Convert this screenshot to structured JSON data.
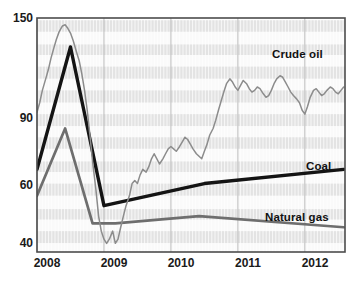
{
  "chart_data": {
    "type": "line",
    "title": "",
    "subtitle": "",
    "xlabel": "",
    "ylabel": "",
    "grid": "horizontal-bands-and-vertical-minor-lines",
    "legend_position": "inline-right-labels",
    "x_axis": {
      "tick_labels": [
        "2008",
        "2009",
        "2010",
        "2011",
        "2012"
      ],
      "tick_values": [
        2008,
        2009,
        2010,
        2011,
        2012
      ],
      "range": [
        2008.0,
        2012.6
      ]
    },
    "y_axis": {
      "tick_labels": [
        "150",
        "90",
        "60",
        "40"
      ],
      "tick_values": [
        150,
        90,
        60,
        40
      ],
      "range": [
        38,
        152
      ],
      "scale": "log"
    },
    "series": [
      {
        "name": "Crude oil",
        "color": "#8c8c8c",
        "label_text": "Crude oil",
        "x": [
          2008.0,
          2008.04,
          2008.08,
          2008.13,
          2008.17,
          2008.21,
          2008.25,
          2008.29,
          2008.33,
          2008.38,
          2008.42,
          2008.46,
          2008.5,
          2008.54,
          2008.58,
          2008.63,
          2008.67,
          2008.71,
          2008.75,
          2008.79,
          2008.83,
          2008.88,
          2008.92,
          2008.96,
          2009.0,
          2009.04,
          2009.08,
          2009.13,
          2009.17,
          2009.21,
          2009.25,
          2009.29,
          2009.33,
          2009.38,
          2009.42,
          2009.46,
          2009.5,
          2009.54,
          2009.58,
          2009.63,
          2009.67,
          2009.71,
          2009.75,
          2009.79,
          2009.83,
          2009.88,
          2009.92,
          2009.96,
          2010.0,
          2010.04,
          2010.08,
          2010.13,
          2010.17,
          2010.21,
          2010.25,
          2010.29,
          2010.33,
          2010.38,
          2010.42,
          2010.46,
          2010.5,
          2010.54,
          2010.58,
          2010.63,
          2010.67,
          2010.71,
          2010.75,
          2010.79,
          2010.83,
          2010.88,
          2010.92,
          2010.96,
          2011.0,
          2011.04,
          2011.08,
          2011.13,
          2011.17,
          2011.21,
          2011.25,
          2011.29,
          2011.33,
          2011.38,
          2011.42,
          2011.46,
          2011.5,
          2011.54,
          2011.58,
          2011.63,
          2011.67,
          2011.71,
          2011.75,
          2011.79,
          2011.83,
          2011.88,
          2011.92,
          2011.96,
          2012.0,
          2012.04,
          2012.08,
          2012.13,
          2012.17,
          2012.21,
          2012.25,
          2012.29,
          2012.33,
          2012.38,
          2012.42,
          2012.46,
          2012.5,
          2012.54,
          2012.58
        ],
        "y": [
          87,
          92,
          99,
          106,
          112,
          120,
          127,
          134,
          140,
          145,
          146,
          143,
          139,
          133,
          126,
          118,
          109,
          99,
          88,
          76,
          65,
          55,
          47,
          43,
          41,
          40,
          41,
          43,
          40,
          41,
          44,
          47,
          50,
          53,
          57,
          58,
          57,
          60,
          62,
          61,
          63,
          66,
          68,
          66,
          64,
          66,
          68,
          70,
          71,
          70,
          69,
          71,
          73,
          75,
          74,
          72,
          70,
          68,
          67,
          66,
          69,
          72,
          76,
          79,
          83,
          88,
          93,
          98,
          103,
          106,
          104,
          101,
          99,
          102,
          105,
          103,
          100,
          98,
          99,
          101,
          100,
          97,
          95,
          96,
          99,
          103,
          106,
          108,
          107,
          104,
          101,
          98,
          96,
          94,
          92,
          88,
          86,
          90,
          95,
          99,
          100,
          98,
          96,
          97,
          99,
          101,
          100,
          98,
          97,
          99,
          101
        ]
      },
      {
        "name": "Coal",
        "color": "#141414",
        "label_text": "Coal",
        "x": [
          2008.0,
          2008.5,
          2009.0,
          2010.5,
          2012.58
        ],
        "y": [
          62,
          128,
          50,
          57,
          62
        ]
      },
      {
        "name": "Natural gas",
        "color": "#6e6e6e",
        "label_text": "Natural gas",
        "x": [
          2008.0,
          2008.42,
          2008.83,
          2009.17,
          2010.42,
          2012.58
        ],
        "y": [
          53,
          79,
          45,
          45,
          47,
          44
        ]
      }
    ]
  },
  "labels": {
    "crude_oil": "Crude oil",
    "coal": "Coal",
    "natural_gas": "Natural gas"
  },
  "y_ticks": [
    "150",
    "90",
    "60",
    "40"
  ],
  "x_ticks": [
    "2008",
    "2009",
    "2010",
    "2011",
    "2012"
  ],
  "colors": {
    "crude_oil": "#8c8c8c",
    "coal": "#141414",
    "natural_gas": "#6e6e6e",
    "band": "#e3e3e3",
    "frame": "#4d4d4d"
  }
}
